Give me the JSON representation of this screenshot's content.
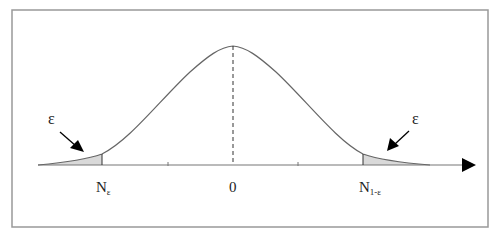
{
  "diagram": {
    "type": "normal-distribution-tails",
    "labels": {
      "left_quantile": "N",
      "left_quantile_sub": "ε",
      "center": "0",
      "right_quantile": "N",
      "right_quantile_sub": "1-ε",
      "left_tail_area": "ε",
      "right_tail_area": "ε"
    },
    "colors": {
      "curve": "#666666",
      "shade": "#d9d9d9",
      "axis": "#777777",
      "frame": "#999999",
      "arrow": "#000000"
    }
  }
}
